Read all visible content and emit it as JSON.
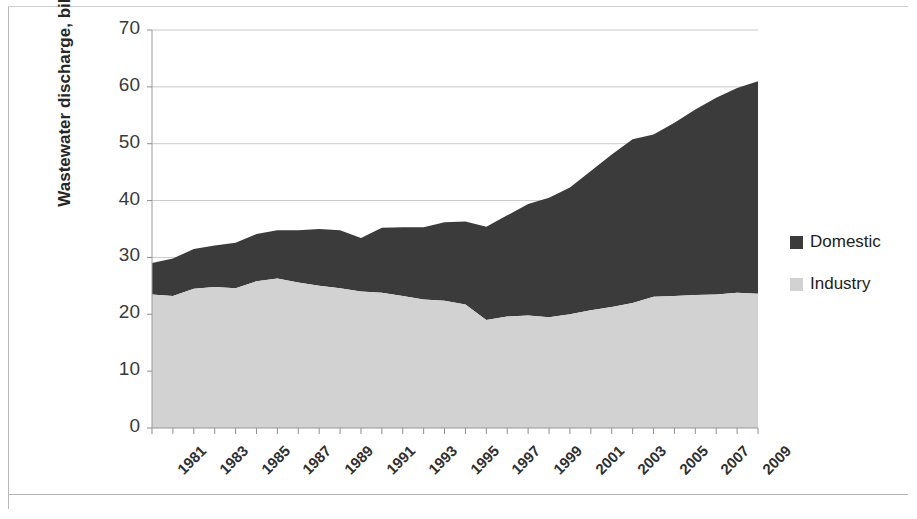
{
  "chart_data": {
    "type": "area",
    "stacked": true,
    "title": "",
    "xlabel": "",
    "ylabel": "Wastewater discharge, billion m3/year",
    "ylim": [
      0,
      70
    ],
    "ytick_labels": [
      "0",
      "10",
      "20",
      "30",
      "40",
      "50",
      "60",
      "70"
    ],
    "ytick_values": [
      0,
      10,
      20,
      30,
      40,
      50,
      60,
      70
    ],
    "grid": true,
    "grid_axis": "y",
    "legend_position": "right",
    "x": [
      1981,
      1982,
      1983,
      1984,
      1985,
      1986,
      1987,
      1988,
      1989,
      1990,
      1991,
      1992,
      1993,
      1994,
      1995,
      1996,
      1997,
      1998,
      1999,
      2000,
      2001,
      2002,
      2003,
      2004,
      2005,
      2006,
      2007,
      2008,
      2009,
      2010
    ],
    "xtick_labels": [
      "1981",
      "1983",
      "1985",
      "1987",
      "1989",
      "1991",
      "1993",
      "1995",
      "1997",
      "1999",
      "2001",
      "2003",
      "2005",
      "2007",
      "2009"
    ],
    "xtick_values": [
      1981,
      1983,
      1985,
      1987,
      1989,
      1991,
      1993,
      1995,
      1997,
      1999,
      2001,
      2003,
      2005,
      2007,
      2009
    ],
    "series": [
      {
        "name": "Industry",
        "color": "#d2d2d2",
        "stack_order": 1,
        "values": [
          23.5,
          23.2,
          24.5,
          24.8,
          24.6,
          25.8,
          26.3,
          25.6,
          25.0,
          24.6,
          24.0,
          23.8,
          23.2,
          22.6,
          22.4,
          21.7,
          19.0,
          19.6,
          19.8,
          19.5,
          20.0,
          20.7,
          21.3,
          22.0,
          23.1,
          23.2,
          23.4,
          23.5,
          23.8,
          23.6
        ]
      },
      {
        "name": "Domestic",
        "color": "#3b3b3b",
        "stack_order": 2,
        "values": [
          5.5,
          6.6,
          7.0,
          7.3,
          8.0,
          8.3,
          8.5,
          9.2,
          10.0,
          10.2,
          9.4,
          11.4,
          12.1,
          12.7,
          13.8,
          14.6,
          16.4,
          17.8,
          19.6,
          21.0,
          22.3,
          24.5,
          26.8,
          28.8,
          28.5,
          30.5,
          32.6,
          34.6,
          36.0,
          37.4
        ]
      }
    ],
    "totals": [
      29.0,
      29.8,
      31.5,
      32.1,
      32.6,
      34.1,
      34.8,
      34.8,
      35.0,
      34.8,
      33.4,
      35.2,
      35.3,
      35.3,
      36.2,
      36.3,
      35.4,
      37.4,
      39.4,
      40.5,
      42.3,
      45.2,
      48.1,
      50.8,
      51.6,
      53.7,
      56.0,
      58.1,
      59.8,
      61.0
    ]
  },
  "legend": {
    "items": [
      {
        "label": "Domestic",
        "color": "#3b3b3b"
      },
      {
        "label": "Industry",
        "color": "#d2d2d2"
      }
    ]
  }
}
